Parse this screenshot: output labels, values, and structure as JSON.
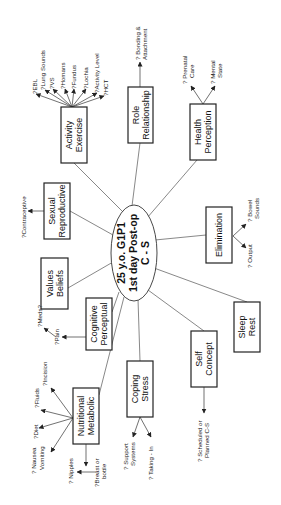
{
  "center": {
    "line1": "25 y.o. G1P1",
    "line2": "1st day Post-op",
    "line3": "C - S"
  },
  "nodes": {
    "activity": {
      "line1": "Activity",
      "line2": "Exercise"
    },
    "role": {
      "line1": "Role",
      "line2": "Relationship"
    },
    "health": {
      "line1": "Health",
      "line2": "Perception"
    },
    "sexual": {
      "line1": "Sexual",
      "line2": "Reproductive"
    },
    "values": {
      "line1": "Values",
      "line2": "Beliefs"
    },
    "cognitive": {
      "line1": "Cognitive",
      "line2": "Perceptual"
    },
    "elimination": {
      "line1": "Elimination"
    },
    "sleep": {
      "line1": "Sleep",
      "line2": "Rest"
    },
    "self": {
      "line1": "Self",
      "line2": "Concept"
    },
    "coping": {
      "line1": "Coping",
      "line2": "Stress"
    },
    "nutritional": {
      "line1": "Nutritional",
      "line2": "Metabolic"
    }
  },
  "leaves": {
    "activity": [
      "?EBL",
      "?Lung Sounds",
      "?VS",
      "?Homans",
      "?Fundus",
      "?Lochia",
      "?Activity Level",
      "?HCT"
    ],
    "role": {
      "line1": "? Bonding &",
      "line2": "Attachment"
    },
    "health": [
      {
        "line1": "? Prenatal",
        "line2": "Care"
      },
      {
        "line1": "? Mental",
        "line2": "State"
      }
    ],
    "sexual": "?Contraceptive",
    "cognitive": [
      "?Pain",
      "?Meds?"
    ],
    "elimination": [
      {
        "line1": "? Bowel",
        "line2": "Sounds"
      },
      {
        "line1": "? Output"
      }
    ],
    "self": {
      "line1": "? Scheduled or",
      "line2": "Planned C-S"
    },
    "coping": [
      {
        "line1": "? Support",
        "line2": "Systems"
      },
      {
        "line1": "? Taking - In"
      }
    ],
    "nutritional": [
      "?Incision",
      "?Fluids",
      "?Diet",
      {
        "line1": "? Nausea",
        "line2": "Vomiting"
      },
      "? Nipples",
      {
        "line1": "?Breast or",
        "line2": "bottle"
      }
    ]
  }
}
